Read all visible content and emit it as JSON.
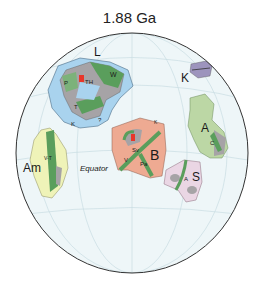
{
  "title": "1.88 Ga",
  "globe": {
    "ocean_color": "#eef6f8",
    "outline_color": "#333333",
    "graticule_color": "#c9dde3"
  },
  "equator_label": "Equator",
  "cratons": {
    "laurentia": {
      "label": "L",
      "sub_labels": [
        "P",
        "TH",
        "W",
        "T",
        "K",
        "?"
      ]
    },
    "kalahari": {
      "label": "K"
    },
    "australia": {
      "label": "A",
      "sub_labels": [
        "C"
      ]
    },
    "baltica": {
      "label": "B",
      "sub_labels": [
        "Sv",
        "V",
        "Pa",
        "K"
      ]
    },
    "amazonia": {
      "label": "Am",
      "sub_labels": [
        "V-T"
      ]
    },
    "sarmatia_siberia": {
      "label": "S",
      "sub_labels": [
        "A"
      ]
    }
  },
  "colors": {
    "shelf_blue": "#a9d3ee",
    "orogen_green": "#5a9e5c",
    "archean_gray": "#a6a3a6",
    "laurentia_light_green": "#7cb27a",
    "baltica_salmon": "#eeaa92",
    "australia_green": "#bcd7a5",
    "amazonia_yellow": "#eff3b8",
    "kalahari_purple": "#9d94bd",
    "siberia_pink": "#ead6e4",
    "red_highlight": "#e8362a"
  }
}
